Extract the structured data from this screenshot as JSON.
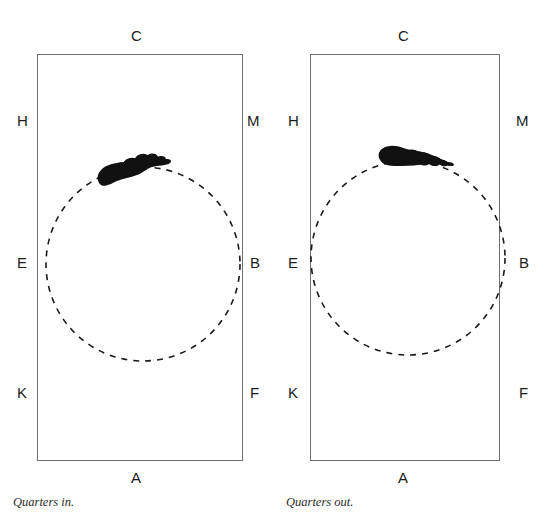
{
  "figure": {
    "width": 558,
    "height": 518,
    "background": "#ffffff",
    "ink_color": "#111111",
    "border_color": "#6e6e6e",
    "dash_color": "#1a1a1a"
  },
  "panels": [
    {
      "id": "quarters-in",
      "caption": "Quarters in.",
      "box": {
        "x": 37,
        "y": 54,
        "w": 206,
        "h": 407
      },
      "circle": {
        "cx": 143,
        "cy": 264,
        "r": 97,
        "style": "dashed"
      },
      "labels": {
        "top": "C",
        "bottom": "A",
        "left_upper": "H",
        "left_middle": "E",
        "left_lower": "K",
        "right_upper": "M",
        "right_middle": "B",
        "right_lower": "F"
      },
      "label_positions": {
        "top": {
          "x": 131,
          "y": 28
        },
        "bottom": {
          "x": 131,
          "y": 470
        },
        "left_upper": {
          "x": 17,
          "y": 113
        },
        "left_middle": {
          "x": 17,
          "y": 255
        },
        "left_lower": {
          "x": 17,
          "y": 385
        },
        "right_upper": {
          "x": 247,
          "y": 113
        },
        "right_middle": {
          "x": 250,
          "y": 255
        },
        "right_lower": {
          "x": 250,
          "y": 385
        }
      },
      "caption_position": {
        "x": 13,
        "y": 495
      },
      "mark": {
        "name": "ink-blob",
        "description": "dense black ink mark resting on upper-left arc of circle, tapering to a thin tail at right",
        "path": "M 99 183 C 95 176, 100 168, 109 165 C 116 162, 124 163, 130 161 C 137 159, 143 155, 150 155 C 157 155, 160 158, 163 159 C 167 160, 172 160, 170 163 C 167 166, 158 165, 152 167 C 146 169, 143 173, 137 175 C 130 178, 124 178, 117 181 C 110 184, 103 189, 99 183 Z",
        "blobs": [
          {
            "cx": 108,
            "cy": 176,
            "rx": 9,
            "ry": 8,
            "rot": -12
          },
          {
            "cx": 120,
            "cy": 170,
            "rx": 9,
            "ry": 7.5,
            "rot": -16
          },
          {
            "cx": 131,
            "cy": 165,
            "rx": 9,
            "ry": 7,
            "rot": -18
          },
          {
            "cx": 142,
            "cy": 160,
            "rx": 8,
            "ry": 6,
            "rot": -18
          },
          {
            "cx": 152,
            "cy": 158,
            "rx": 6,
            "ry": 4.5,
            "rot": -12
          },
          {
            "cx": 161,
            "cy": 159,
            "rx": 5,
            "ry": 3,
            "rot": -2
          },
          {
            "cx": 167,
            "cy": 161,
            "rx": 4,
            "ry": 2,
            "rot": 6
          }
        ]
      }
    },
    {
      "id": "quarters-out",
      "caption": "Quarters out.",
      "box": {
        "x": 310,
        "y": 54,
        "w": 190,
        "h": 407
      },
      "circle": {
        "cx": 408,
        "cy": 258,
        "r": 97,
        "style": "dashed"
      },
      "labels": {
        "top": "C",
        "bottom": "A",
        "left_upper": "H",
        "left_middle": "E",
        "left_lower": "K",
        "right_upper": "M",
        "right_middle": "B",
        "right_lower": "F"
      },
      "label_positions": {
        "top": {
          "x": 398,
          "y": 28
        },
        "bottom": {
          "x": 398,
          "y": 470
        },
        "left_upper": {
          "x": 288,
          "y": 113
        },
        "left_middle": {
          "x": 288,
          "y": 255
        },
        "left_lower": {
          "x": 288,
          "y": 385
        },
        "right_upper": {
          "x": 516,
          "y": 113
        },
        "right_middle": {
          "x": 519,
          "y": 255
        },
        "right_lower": {
          "x": 519,
          "y": 385
        }
      },
      "caption_position": {
        "x": 286,
        "y": 495
      },
      "mark": {
        "name": "ink-blob",
        "description": "dense black ink mark resting on the top arc of circle, slightly left of apex, tapering right",
        "path": "M 380 160 C 376 153, 381 147, 390 146 C 398 145, 404 149, 411 150 C 418 151, 425 152, 432 155 C 439 158, 446 161, 450 163 C 453 165, 451 167, 446 165 C 440 163, 433 163, 426 164 C 418 165, 410 166, 402 166 C 394 166, 384 167, 380 160 Z",
        "blobs": [
          {
            "cx": 388,
            "cy": 155,
            "rx": 9,
            "ry": 8,
            "rot": -8
          },
          {
            "cx": 400,
            "cy": 156,
            "rx": 9,
            "ry": 8,
            "rot": -4
          },
          {
            "cx": 412,
            "cy": 157,
            "rx": 9,
            "ry": 7.5,
            "rot": 2
          },
          {
            "cx": 424,
            "cy": 159,
            "rx": 8,
            "ry": 6.5,
            "rot": 8
          },
          {
            "cx": 434,
            "cy": 161,
            "rx": 7,
            "ry": 5,
            "rot": 12
          },
          {
            "cx": 443,
            "cy": 163,
            "rx": 5.5,
            "ry": 3,
            "rot": 14
          },
          {
            "cx": 450,
            "cy": 164,
            "rx": 4,
            "ry": 1.8,
            "rot": 14
          }
        ]
      }
    }
  ]
}
